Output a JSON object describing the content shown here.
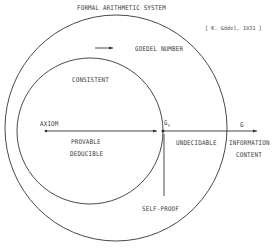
{
  "title": "FORMAL ARITHMETIC SYSTEM",
  "citation": "[ K. Gödel, 1931 ]",
  "labels": {
    "goedel_number": "GOEDEL NUMBER",
    "consistent": "CONSISTENT",
    "axiom": "AXIOM",
    "provable": "PROVABLE",
    "deducible": "DEDUCIBLE",
    "gc": "G",
    "gc_sub": "c",
    "g": "G",
    "undecidable": "UNDECIDABLE",
    "information": "INFORMATION",
    "content": "CONTENT",
    "self_proof": "SELF-PROOF"
  },
  "colors": {
    "stroke": "#333333",
    "text": "#3a3a3a",
    "background": "#ffffff"
  }
}
